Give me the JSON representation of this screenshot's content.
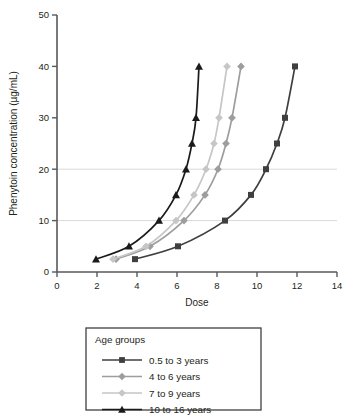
{
  "chart_data": {
    "type": "line",
    "title": "",
    "xlabel": "Dose",
    "ylabel": "Phenytoin concentration (µg/mL)",
    "xlim": [
      0,
      14
    ],
    "ylim": [
      0,
      50
    ],
    "xticks": [
      0,
      2,
      4,
      6,
      8,
      10,
      12,
      14
    ],
    "yticks": [
      0,
      10,
      20,
      30,
      40,
      50
    ],
    "grid": "horizontal gridlines at y=10 and y=20 only",
    "gridline_values": [
      10,
      20
    ],
    "legend_position": "below plot, centered",
    "legend_title": "Age groups",
    "series": [
      {
        "name": "0.5 to 3 years",
        "marker": "square",
        "color": "#3f3f3f",
        "x": [
          3.9,
          6.05,
          8.4,
          9.7,
          10.45,
          11.0,
          11.4,
          11.9
        ],
        "y": [
          2.5,
          5,
          10,
          15,
          20,
          25,
          30,
          40
        ]
      },
      {
        "name": "4 to 6 years",
        "marker": "diamond",
        "color": "#9d9d9d",
        "x": [
          2.95,
          4.65,
          6.35,
          7.4,
          8.05,
          8.45,
          8.75,
          9.2
        ],
        "y": [
          2.5,
          5,
          10,
          15,
          20,
          25,
          30,
          40
        ]
      },
      {
        "name": "7 to 9 years",
        "marker": "diamond",
        "color": "#c6c6c6",
        "x": [
          2.8,
          4.45,
          5.95,
          6.85,
          7.45,
          7.85,
          8.1,
          8.5
        ],
        "y": [
          2.5,
          5,
          10,
          15,
          20,
          25,
          30,
          40
        ]
      },
      {
        "name": "10 to 16 years",
        "marker": "triangle",
        "color": "#1a1a1a",
        "x": [
          1.95,
          3.6,
          5.1,
          5.95,
          6.45,
          6.75,
          6.95,
          7.1
        ],
        "y": [
          2.5,
          5,
          10,
          15,
          20,
          25,
          30,
          40
        ]
      }
    ]
  },
  "legend": {
    "title": "Age groups",
    "entries": [
      {
        "label": "0.5 to 3 years"
      },
      {
        "label": "4 to 6 years"
      },
      {
        "label": "7 to 9 years"
      },
      {
        "label": "10 to 16 years"
      }
    ]
  }
}
